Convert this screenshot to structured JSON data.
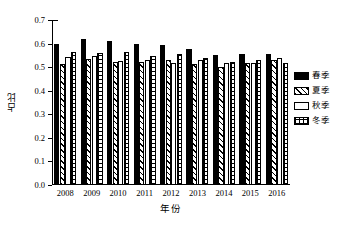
{
  "chart_data": {
    "type": "bar",
    "title": "",
    "xlabel": "年份",
    "ylabel": "占比",
    "categories": [
      "2008",
      "2009",
      "2010",
      "2011",
      "2012",
      "2013",
      "2014",
      "2015",
      "2016"
    ],
    "series": [
      {
        "name": "春季",
        "pattern": "solid-black",
        "values": [
          0.6,
          0.619,
          0.612,
          0.599,
          0.592,
          0.578,
          0.551,
          0.556,
          0.556
        ]
      },
      {
        "name": "夏季",
        "pattern": "diagonal-hatch",
        "values": [
          0.515,
          0.533,
          0.52,
          0.524,
          0.532,
          0.512,
          0.502,
          0.516,
          0.532
        ]
      },
      {
        "name": "秋季",
        "pattern": "white-empty",
        "values": [
          0.543,
          0.549,
          0.528,
          0.531,
          0.519,
          0.531,
          0.516,
          0.517,
          0.538
        ]
      },
      {
        "name": "冬季",
        "pattern": "crosshatch-grid",
        "values": [
          0.565,
          0.562,
          0.564,
          0.546,
          0.556,
          0.539,
          0.52,
          0.532,
          0.519
        ]
      }
    ],
    "ylim": [
      0.0,
      0.7
    ],
    "yticks": [
      "0.0",
      "0.1",
      "0.2",
      "0.3",
      "0.4",
      "0.5",
      "0.6",
      "0.7"
    ],
    "ytick_values": [
      0.0,
      0.1,
      0.2,
      0.3,
      0.4,
      0.5,
      0.6,
      0.7
    ],
    "grid": false,
    "legend_position": "right",
    "axis_color": "#000000",
    "background_color": "#ffffff"
  },
  "legend": {
    "items": [
      {
        "label": "春季"
      },
      {
        "label": "夏季"
      },
      {
        "label": "秋季"
      },
      {
        "label": "冬季"
      }
    ]
  }
}
